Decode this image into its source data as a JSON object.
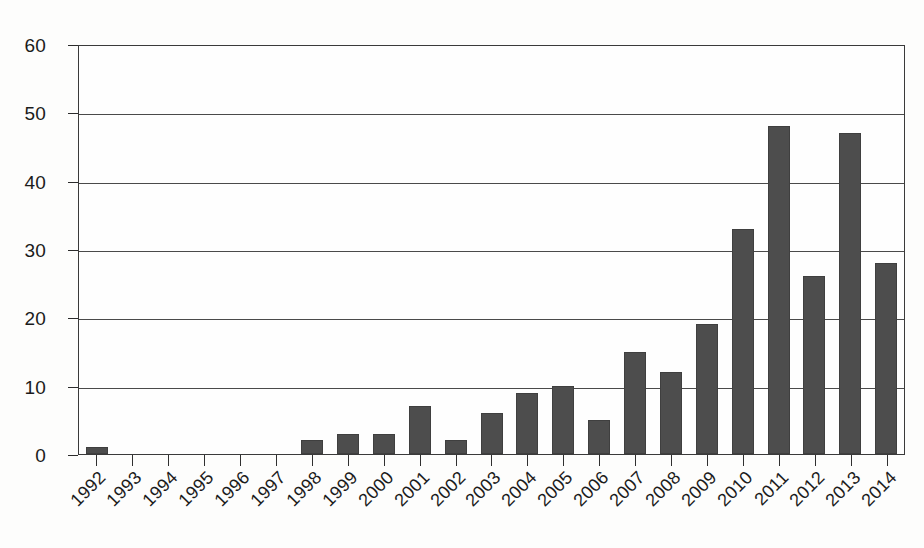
{
  "chart_data": {
    "type": "bar",
    "title": "",
    "subtitle": "",
    "xlabel": "",
    "ylabel": "",
    "categories": [
      "1992",
      "1993",
      "1994",
      "1995",
      "1996",
      "1997",
      "1998",
      "1999",
      "2000",
      "2001",
      "2002",
      "2003",
      "2004",
      "2005",
      "2006",
      "2007",
      "2008",
      "2009",
      "2010",
      "2011",
      "2012",
      "2013",
      "2014"
    ],
    "values": [
      1,
      0,
      0,
      0,
      0,
      0,
      2,
      3,
      3,
      7,
      2,
      6,
      9,
      10,
      5,
      15,
      12,
      19,
      33,
      48,
      26,
      47,
      28
    ],
    "series": [
      {
        "name": "",
        "values": [
          1,
          0,
          0,
          0,
          0,
          0,
          2,
          3,
          3,
          7,
          2,
          6,
          9,
          10,
          5,
          15,
          12,
          19,
          33,
          48,
          26,
          47,
          28
        ]
      }
    ],
    "ylim": [
      0,
      60
    ],
    "y_ticks": [
      0,
      10,
      20,
      30,
      40,
      50,
      60
    ],
    "y_tick_labels": [
      "0",
      "10",
      "20",
      "30",
      "40",
      "50",
      "60"
    ],
    "grid": true,
    "grid_axis": "y",
    "legend": false,
    "legend_position": "none",
    "bar_color": "#4d4d4d",
    "axis_color": "#3a3a3a",
    "background_color": "#fefefe",
    "x_tick_rotation": -45
  }
}
